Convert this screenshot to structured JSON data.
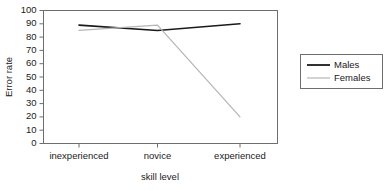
{
  "chart_data": {
    "type": "line",
    "title": "",
    "xlabel": "skill level",
    "ylabel": "Error rate",
    "categories": [
      "inexperienced",
      "novice",
      "experienced"
    ],
    "series": [
      {
        "name": "Males",
        "values": [
          89,
          85,
          90
        ],
        "color": "#1a1a1a"
      },
      {
        "name": "Females",
        "values": [
          85,
          89,
          20
        ],
        "color": "#b5b5b5"
      }
    ],
    "ylim": [
      0,
      100
    ],
    "yticks": [
      0,
      10,
      20,
      30,
      40,
      50,
      60,
      70,
      80,
      90,
      100
    ],
    "ytick_labels": [
      "0",
      "10",
      "20",
      "30",
      "40",
      "50",
      "60",
      "70",
      "80",
      "90",
      "100"
    ],
    "grid": false,
    "legend_position": "right",
    "frame": true
  },
  "axes": {
    "y_title": "Error rate",
    "x_title": "skill level"
  },
  "legend": {
    "entries": [
      {
        "label": "Males"
      },
      {
        "label": "Females"
      }
    ]
  },
  "ticks": {
    "y": [
      "0",
      "10",
      "20",
      "30",
      "40",
      "50",
      "60",
      "70",
      "80",
      "90",
      "100"
    ],
    "x": [
      "inexperienced",
      "novice",
      "experienced"
    ]
  }
}
